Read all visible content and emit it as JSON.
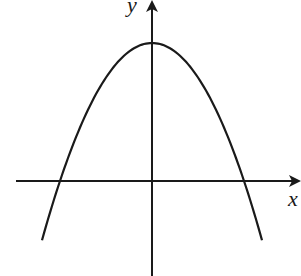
{
  "diagram": {
    "type": "parabola-graph",
    "axes": {
      "x_label": "x",
      "y_label": "y"
    },
    "colors": {
      "stroke": "#1a1a1a",
      "background": "#ffffff"
    },
    "geometry_px": {
      "origin": [
        152,
        181
      ],
      "x_axis": {
        "from": 16,
        "to": 299
      },
      "y_axis": {
        "from": 2,
        "to": 276
      },
      "vertex": [
        152,
        43
      ],
      "x_intercepts": [
        60,
        244
      ],
      "curve_x_range": [
        42,
        262
      ],
      "curvature_k": 0.0163
    }
  }
}
